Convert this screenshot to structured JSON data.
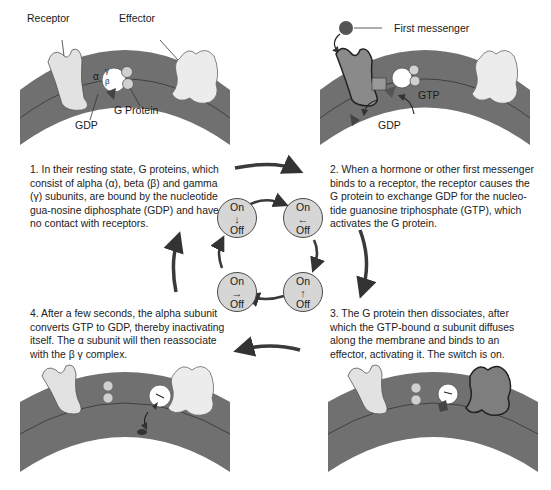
{
  "figure": {
    "panels": [
      {
        "id": 1,
        "labels": {
          "receptor": "Receptor",
          "effector": "Effector",
          "gdp": "GDP",
          "g_protein": "G Protein",
          "alpha": "α",
          "beta": "β",
          "gamma": "γ"
        }
      },
      {
        "id": 2,
        "labels": {
          "first_messenger": "First messenger",
          "gtp": "GTP",
          "gdp": "GDP"
        }
      },
      {
        "id": 3,
        "labels": {}
      },
      {
        "id": 4,
        "labels": {}
      }
    ],
    "steps": [
      {
        "number": 1,
        "text": "1. In their resting state, G proteins, which consist of alpha (α), beta (β) and gamma (γ) subunits, are bound by the nucleotide gua-nosine diphosphate (GDP) and have no contact with receptors."
      },
      {
        "number": 2,
        "text": "2. When a hormone or other first messenger binds to a receptor, the receptor causes the G protein to exchange GDP for the nucleo-tide guanosine triphosphate (GTP), which activates the G protein."
      },
      {
        "number": 3,
        "text": "3. The G protein then dissociates, after which the GTP-bound α subunit diffuses along the membrane and binds to an effector, activating it. The switch is on."
      },
      {
        "number": 4,
        "text": "4. After a few seconds, the alpha subunit converts GTP to GDP, thereby inactivating itself. The α subunit will then reassociate with the β γ complex."
      }
    ],
    "switches": [
      {
        "position": "top-left",
        "on": "On",
        "off": "Off",
        "arrow": "↓"
      },
      {
        "position": "top-right",
        "on": "On",
        "off": "Off",
        "arrow": "←"
      },
      {
        "position": "bottom-right",
        "on": "On",
        "off": "Off",
        "arrow": "↑"
      },
      {
        "position": "bottom-left",
        "on": "On",
        "off": "Off",
        "arrow": "→"
      }
    ],
    "colors": {
      "membrane_dark": "#6e6e6e",
      "membrane_light": "#9a9a9a",
      "protein_light": "#e6e6e6",
      "protein_dark": "#7a7a7a",
      "switch_fill": "#d6d6d6",
      "arrow": "#3a3a3a"
    }
  }
}
